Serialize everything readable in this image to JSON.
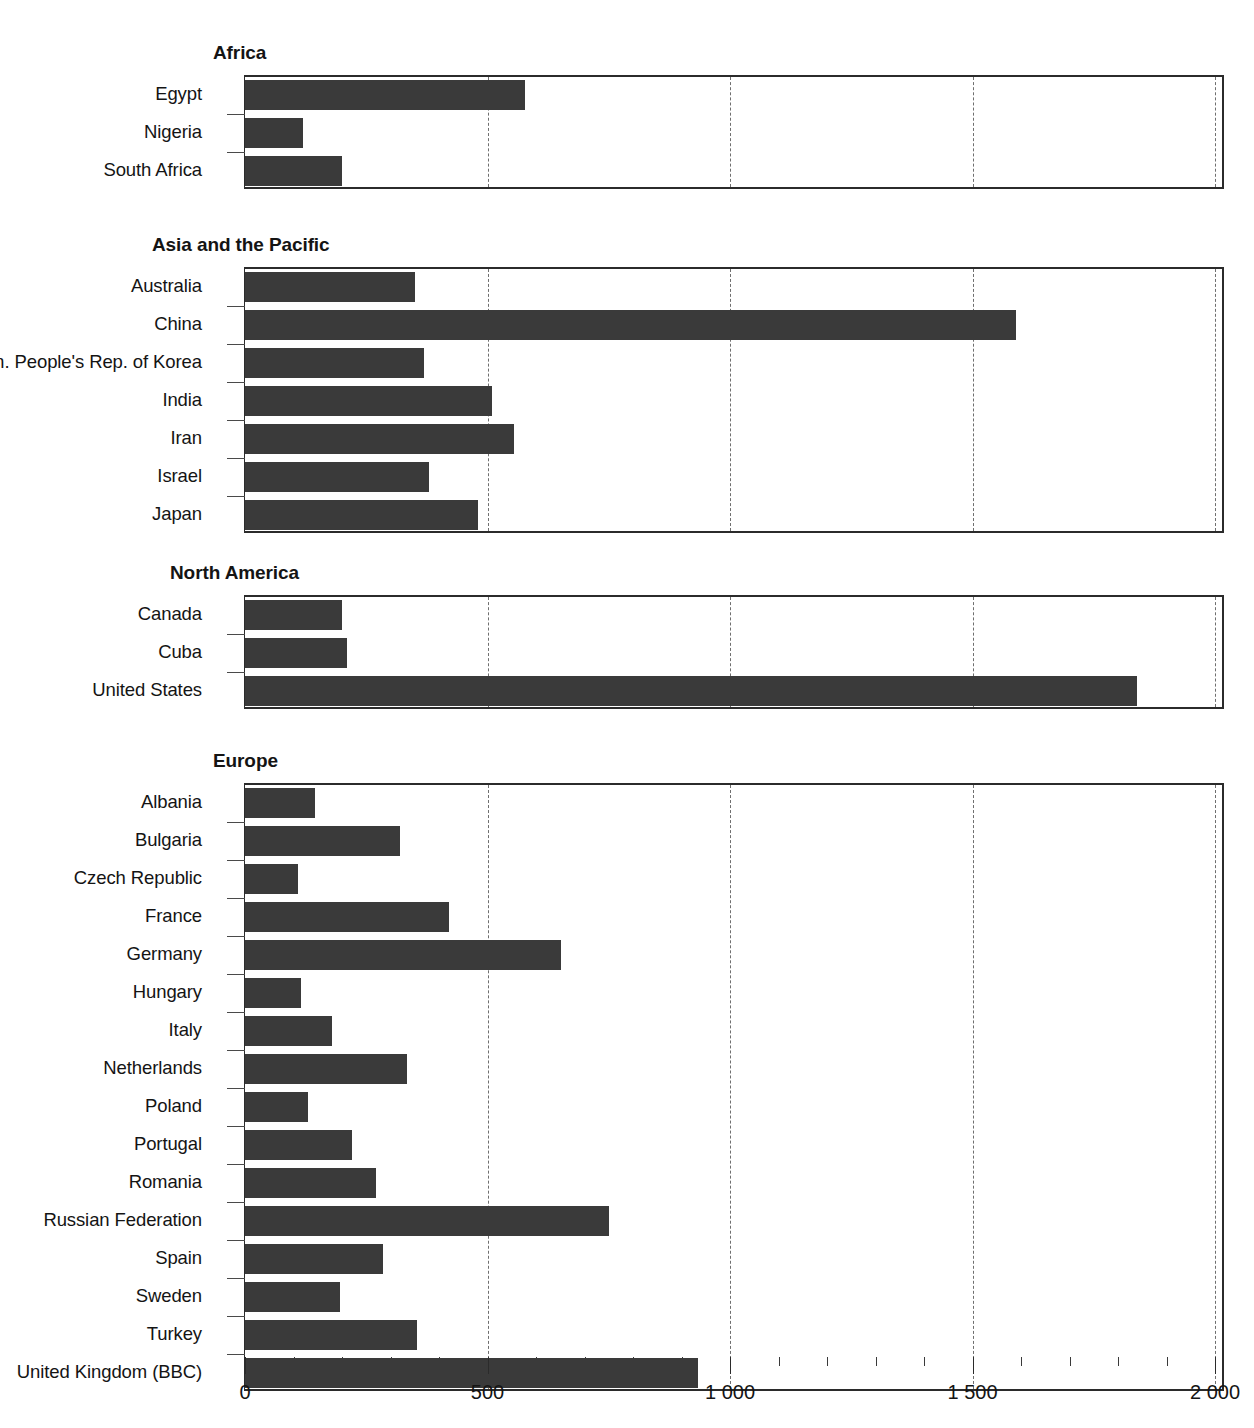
{
  "chart_data": {
    "type": "bar",
    "orientation": "horizontal",
    "title": "",
    "xlabel": "",
    "ylabel": "",
    "xlim": [
      0,
      2000
    ],
    "xticks": [
      0,
      500,
      1000,
      1500,
      2000
    ],
    "xtick_labels": [
      "0",
      "500",
      "1 000",
      "1 500",
      "2 000"
    ],
    "minor_tick_step": 100,
    "grid": "vertical dashed gridlines at 500, 1000, 1500, 2000",
    "legend": "none",
    "bar_color": "#3a3a3a",
    "panels": [
      {
        "name": "Africa",
        "categories": [
          "Egypt",
          "Nigeria",
          "South Africa"
        ],
        "values": [
          578,
          120,
          200
        ]
      },
      {
        "name": "Asia and the Pacific",
        "categories": [
          "Australia",
          "China",
          "Dem. People's Rep. of Korea",
          "India",
          "Iran",
          "Israel",
          "Japan"
        ],
        "values": [
          350,
          1589,
          370,
          510,
          555,
          380,
          480
        ]
      },
      {
        "name": "North America",
        "categories": [
          "Canada",
          "Cuba",
          "United States"
        ],
        "values": [
          200,
          210,
          1839
        ]
      },
      {
        "name": "Europe",
        "categories": [
          "Albania",
          "Bulgaria",
          "Czech Republic",
          "France",
          "Germany",
          "Hungary",
          "Italy",
          "Netherlands",
          "Poland",
          "Portugal",
          "Romania",
          "Russian Federation",
          "Spain",
          "Sweden",
          "Turkey",
          "United Kingdom (BBC)"
        ],
        "values": [
          145,
          320,
          110,
          420,
          651,
          115,
          180,
          335,
          130,
          220,
          270,
          750,
          285,
          195,
          355,
          934
        ]
      }
    ]
  },
  "layout": {
    "panel_tops": [
      75,
      267,
      595,
      783
    ],
    "panel_title_tops": [
      42,
      234,
      562,
      750
    ],
    "panel_title_lefts": [
      213,
      152,
      170,
      213
    ],
    "row_pitch": 38,
    "plot_left": 245,
    "plot_right": 1224,
    "px_per_unit": 0.485
  }
}
